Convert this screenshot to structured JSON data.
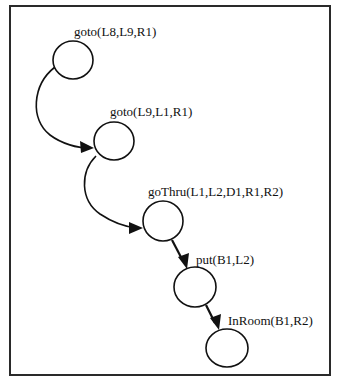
{
  "diagram": {
    "type": "plan-sequence-graph",
    "frame": {
      "x": 10,
      "y": 6,
      "width": 320,
      "height": 369,
      "stroke": "#2a2a2a"
    },
    "nodes": [
      {
        "id": "n1",
        "label": "goto(L8,L9,R1)",
        "cx": 73,
        "cy": 60,
        "rx": 20,
        "ry": 19,
        "label_x": 74,
        "label_y": 36
      },
      {
        "id": "n2",
        "label": "goto(L9,L1,R1)",
        "cx": 114,
        "cy": 141,
        "rx": 20,
        "ry": 19,
        "label_x": 110,
        "label_y": 116
      },
      {
        "id": "n3",
        "label": "goThru(L1,L2,D1,R1,R2)",
        "cx": 163,
        "cy": 221,
        "rx": 20,
        "ry": 20,
        "label_x": 148,
        "label_y": 196
      },
      {
        "id": "n4",
        "label": "put(B1,L2)",
        "cx": 195,
        "cy": 287,
        "rx": 21,
        "ry": 20,
        "label_x": 196,
        "label_y": 264
      },
      {
        "id": "n5",
        "label": "InRoom(B1,R2)",
        "cx": 227,
        "cy": 348,
        "rx": 21,
        "ry": 19,
        "label_x": 228,
        "label_y": 325
      }
    ],
    "edges": [
      {
        "from": "n1",
        "to": "n2",
        "style": "curved"
      },
      {
        "from": "n2",
        "to": "n3",
        "style": "curved"
      },
      {
        "from": "n3",
        "to": "n4",
        "style": "straight"
      },
      {
        "from": "n4",
        "to": "n5",
        "style": "straight"
      }
    ],
    "colors": {
      "background": "#ffffff",
      "stroke": "#111111"
    }
  }
}
